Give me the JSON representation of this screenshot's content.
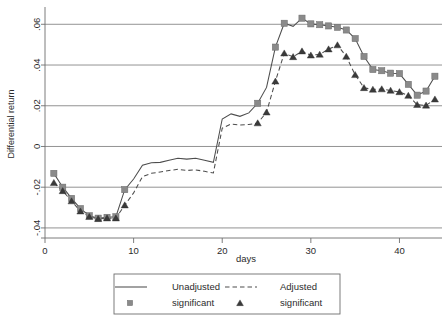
{
  "chart_data": {
    "type": "line",
    "title": "",
    "xlabel": "days",
    "ylabel": "Differential return",
    "xlim": [
      0,
      44.8
    ],
    "ylim": [
      -0.042,
      0.068
    ],
    "grid": true,
    "grid_axis": "y",
    "legend_position": "bottom-outside",
    "x_ticks": [
      0,
      10,
      20,
      30,
      40
    ],
    "x_tick_labels": [
      "0",
      "10",
      "20",
      "30",
      "40"
    ],
    "y_ticks": [
      -0.04,
      -0.02,
      0,
      0.02,
      0.04,
      0.06
    ],
    "y_tick_labels": [
      "-.04",
      "-.02",
      "0",
      ".02",
      ".04",
      ".06"
    ],
    "x": [
      1,
      2,
      3,
      4,
      5,
      6,
      7,
      8,
      9,
      10,
      11,
      12,
      13,
      14,
      15,
      16,
      17,
      18,
      19,
      20,
      21,
      22,
      23,
      24,
      25,
      26,
      27,
      28,
      29,
      30,
      31,
      32,
      33,
      34,
      35,
      36,
      37,
      38,
      39,
      40,
      41,
      42,
      43,
      44
    ],
    "series": [
      {
        "name": "Unadjusted",
        "style": "solid",
        "color": "#4d4d4d",
        "values": [
          -0.0132,
          -0.02,
          -0.0255,
          -0.0305,
          -0.034,
          -0.0352,
          -0.0348,
          -0.0345,
          -0.0212,
          -0.016,
          -0.0092,
          -0.008,
          -0.0078,
          -0.0068,
          -0.0058,
          -0.0062,
          -0.0058,
          -0.0068,
          -0.0078,
          0.0135,
          0.016,
          0.0148,
          0.0165,
          0.0212,
          0.029,
          0.0488,
          0.0605,
          0.059,
          0.063,
          0.0602,
          0.0598,
          0.0592,
          0.0585,
          0.0572,
          0.053,
          0.0442,
          0.0378,
          0.0372,
          0.036,
          0.0358,
          0.0305,
          0.0252,
          0.0272,
          0.0345
        ],
        "significant_points": [
          {
            "x": 1,
            "y": -0.0132
          },
          {
            "x": 2,
            "y": -0.02
          },
          {
            "x": 3,
            "y": -0.0255
          },
          {
            "x": 4,
            "y": -0.0305
          },
          {
            "x": 5,
            "y": -0.034
          },
          {
            "x": 6,
            "y": -0.0352
          },
          {
            "x": 7,
            "y": -0.0348
          },
          {
            "x": 8,
            "y": -0.0345
          },
          {
            "x": 9,
            "y": -0.0212
          },
          {
            "x": 24,
            "y": 0.0212
          },
          {
            "x": 26,
            "y": 0.0488
          },
          {
            "x": 27,
            "y": 0.0605
          },
          {
            "x": 29,
            "y": 0.063
          },
          {
            "x": 30,
            "y": 0.0602
          },
          {
            "x": 31,
            "y": 0.0598
          },
          {
            "x": 32,
            "y": 0.0592
          },
          {
            "x": 33,
            "y": 0.0585
          },
          {
            "x": 34,
            "y": 0.0572
          },
          {
            "x": 35,
            "y": 0.053
          },
          {
            "x": 36,
            "y": 0.0442
          },
          {
            "x": 37,
            "y": 0.0378
          },
          {
            "x": 38,
            "y": 0.0372
          },
          {
            "x": 39,
            "y": 0.036
          },
          {
            "x": 40,
            "y": 0.0358
          },
          {
            "x": 41,
            "y": 0.0305
          },
          {
            "x": 42,
            "y": 0.0252
          },
          {
            "x": 43,
            "y": 0.0272
          },
          {
            "x": 44,
            "y": 0.0345
          }
        ]
      },
      {
        "name": "Adjusted",
        "style": "dashed",
        "color": "#4d4d4d",
        "values": [
          -0.0178,
          -0.0218,
          -0.0268,
          -0.0318,
          -0.0345,
          -0.0355,
          -0.0352,
          -0.0352,
          -0.0288,
          -0.0228,
          -0.0148,
          -0.0132,
          -0.0125,
          -0.0118,
          -0.0112,
          -0.0118,
          -0.0115,
          -0.0122,
          -0.013,
          0.009,
          0.011,
          0.0105,
          0.0108,
          0.0115,
          0.0168,
          0.032,
          0.0458,
          0.044,
          0.0468,
          0.0448,
          0.0452,
          0.0478,
          0.0498,
          0.0442,
          0.0352,
          0.0288,
          0.028,
          0.0282,
          0.0275,
          0.0268,
          0.025,
          0.0205,
          0.0202,
          0.0232
        ],
        "significant_points": [
          {
            "x": 1,
            "y": -0.0178
          },
          {
            "x": 2,
            "y": -0.0218
          },
          {
            "x": 3,
            "y": -0.0268
          },
          {
            "x": 4,
            "y": -0.0318
          },
          {
            "x": 5,
            "y": -0.0345
          },
          {
            "x": 6,
            "y": -0.0355
          },
          {
            "x": 7,
            "y": -0.0352
          },
          {
            "x": 8,
            "y": -0.0352
          },
          {
            "x": 9,
            "y": -0.0288
          },
          {
            "x": 24,
            "y": 0.0115
          },
          {
            "x": 25,
            "y": 0.0168
          },
          {
            "x": 26,
            "y": 0.032
          },
          {
            "x": 27,
            "y": 0.0458
          },
          {
            "x": 28,
            "y": 0.044
          },
          {
            "x": 29,
            "y": 0.0468
          },
          {
            "x": 30,
            "y": 0.0448
          },
          {
            "x": 31,
            "y": 0.0452
          },
          {
            "x": 32,
            "y": 0.0478
          },
          {
            "x": 33,
            "y": 0.0498
          },
          {
            "x": 34,
            "y": 0.0442
          },
          {
            "x": 35,
            "y": 0.0352
          },
          {
            "x": 36,
            "y": 0.0288
          },
          {
            "x": 37,
            "y": 0.028
          },
          {
            "x": 38,
            "y": 0.0282
          },
          {
            "x": 39,
            "y": 0.0275
          },
          {
            "x": 40,
            "y": 0.0268
          },
          {
            "x": 41,
            "y": 0.025
          },
          {
            "x": 42,
            "y": 0.0205
          },
          {
            "x": 43,
            "y": 0.0202
          },
          {
            "x": 44,
            "y": 0.0232
          }
        ]
      }
    ],
    "legend": [
      {
        "label": "Unadjusted",
        "marker": "solid-line"
      },
      {
        "label": "Adjusted",
        "marker": "dashed-line"
      },
      {
        "label": "significant",
        "marker": "square"
      },
      {
        "label": "significant",
        "marker": "triangle"
      }
    ]
  },
  "colors": {
    "line": "#4d4d4d",
    "square_marker": "#8a8a8a",
    "triangle_marker": "#3a3a3a",
    "grid": "#878787",
    "axis": "#6e6e6e",
    "text": "#2b2b2b",
    "background": "#ffffff"
  }
}
